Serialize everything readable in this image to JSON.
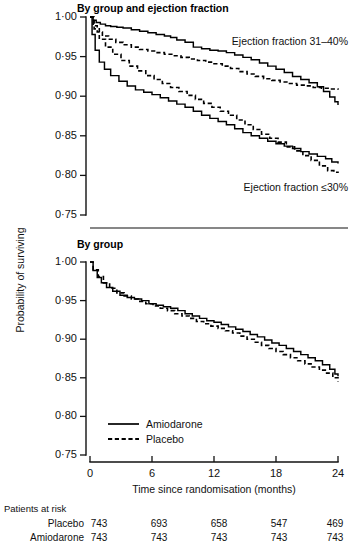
{
  "figure": {
    "y_axis_label": "Probability of surviving",
    "x_axis_label": "Time since randomisation (months)",
    "y_ticks": [
      "1·00",
      "0·95",
      "0·90",
      "0·85",
      "0·80",
      "0·75"
    ],
    "x_ticks": [
      "0",
      "6",
      "12",
      "18",
      "24"
    ],
    "colors": {
      "ink": "#000000",
      "axis": "#111111",
      "background": "#ffffff"
    }
  },
  "panel_top": {
    "title": "By group and ejection fraction",
    "annotation_upper": "Ejection fraction 31–40%",
    "annotation_lower": "Ejection fraction ≤30%"
  },
  "panel_bottom": {
    "title": "By group",
    "legend": [
      {
        "label": "Amiodarone",
        "style": "solid"
      },
      {
        "label": "Placebo",
        "style": "dashed"
      }
    ]
  },
  "risk_table": {
    "heading": "Patients at risk",
    "rows": [
      {
        "label": "Placebo",
        "values": [
          "743",
          "693",
          "658",
          "547",
          "469"
        ]
      },
      {
        "label": "Amiodarone",
        "values": [
          "743",
          "743",
          "743",
          "743",
          "743"
        ]
      }
    ]
  },
  "chart_data": {
    "type": "line",
    "xlabel": "Time since randomisation (months)",
    "ylabel": "Probability of surviving",
    "xlim": [
      0,
      24
    ],
    "ylim": [
      0.75,
      1.0
    ],
    "xticks": [
      0,
      6,
      12,
      18,
      24
    ],
    "yticks": [
      0.75,
      0.8,
      0.85,
      0.9,
      0.95,
      1.0
    ],
    "grid": false,
    "legend_position": "inside-bottom-left",
    "panels": [
      {
        "name": "By group and ejection fraction",
        "annotations": [
          {
            "text": "Ejection fraction 31–40%",
            "x": 13.5,
            "y": 0.962
          },
          {
            "text": "Ejection fraction ≤30%",
            "x": 14.5,
            "y": 0.787
          }
        ],
        "series": [
          {
            "name": "Amiodarone, ejection fraction 31–40%",
            "style": "solid",
            "x": [
              0.0,
              0.3,
              0.6,
              1.0,
              1.5,
              2.0,
              2.6,
              3.2,
              4.0,
              4.8,
              5.6,
              6.4,
              7.2,
              7.8,
              8.4,
              9.2,
              10.0,
              10.8,
              11.6,
              12.4,
              13.2,
              14.0,
              14.8,
              15.6,
              16.4,
              17.2,
              18.0,
              18.8,
              19.6,
              20.4,
              21.2,
              22.0,
              22.6,
              23.2,
              23.7,
              24.0
            ],
            "y": [
              1.0,
              0.996,
              0.993,
              0.991,
              0.989,
              0.988,
              0.987,
              0.986,
              0.984,
              0.982,
              0.98,
              0.978,
              0.976,
              0.974,
              0.971,
              0.968,
              0.962,
              0.96,
              0.958,
              0.957,
              0.955,
              0.952,
              0.949,
              0.946,
              0.942,
              0.938,
              0.934,
              0.93,
              0.925,
              0.921,
              0.917,
              0.912,
              0.906,
              0.899,
              0.893,
              0.889
            ]
          },
          {
            "name": "Placebo, ejection fraction 31–40%",
            "style": "dashed",
            "x": [
              0.0,
              0.3,
              0.7,
              1.2,
              1.8,
              2.5,
              3.2,
              4.0,
              4.8,
              5.6,
              6.4,
              7.2,
              8.0,
              8.8,
              9.6,
              10.4,
              11.2,
              12.0,
              12.8,
              13.6,
              14.4,
              15.2,
              16.0,
              16.8,
              17.6,
              18.4,
              19.2,
              20.0,
              20.8,
              21.6,
              22.4,
              23.2,
              24.0
            ],
            "y": [
              1.0,
              0.989,
              0.981,
              0.976,
              0.972,
              0.968,
              0.965,
              0.962,
              0.959,
              0.957,
              0.955,
              0.953,
              0.951,
              0.949,
              0.947,
              0.945,
              0.943,
              0.941,
              0.938,
              0.935,
              0.931,
              0.928,
              0.925,
              0.922,
              0.92,
              0.918,
              0.916,
              0.914,
              0.913,
              0.911,
              0.91,
              0.909,
              0.908
            ]
          },
          {
            "name": "Amiodarone, ejection fraction ≤30%",
            "style": "solid",
            "x": [
              0.0,
              0.2,
              0.5,
              0.9,
              1.4,
              2.0,
              2.8,
              3.6,
              4.4,
              5.2,
              6.0,
              6.8,
              7.6,
              8.4,
              9.2,
              10.0,
              10.8,
              11.6,
              12.4,
              13.2,
              14.0,
              14.8,
              15.6,
              16.4,
              17.2,
              18.0,
              18.8,
              19.6,
              20.4,
              21.2,
              22.0,
              22.8,
              23.4,
              24.0
            ],
            "y": [
              1.0,
              0.978,
              0.958,
              0.943,
              0.934,
              0.926,
              0.919,
              0.913,
              0.908,
              0.905,
              0.902,
              0.898,
              0.894,
              0.89,
              0.886,
              0.881,
              0.876,
              0.872,
              0.868,
              0.864,
              0.859,
              0.854,
              0.85,
              0.847,
              0.843,
              0.84,
              0.837,
              0.834,
              0.83,
              0.827,
              0.824,
              0.821,
              0.817,
              0.815
            ]
          },
          {
            "name": "Placebo, ejection fraction ≤30%",
            "style": "dashed",
            "x": [
              0.0,
              0.4,
              0.9,
              1.5,
              2.2,
              3.0,
              3.8,
              4.6,
              5.4,
              6.2,
              7.0,
              7.8,
              8.6,
              9.4,
              10.2,
              11.0,
              11.8,
              12.6,
              13.4,
              14.2,
              15.0,
              15.8,
              16.6,
              17.4,
              18.2,
              19.0,
              19.8,
              20.6,
              21.4,
              22.2,
              23.0,
              23.6,
              24.0
            ],
            "y": [
              1.0,
              0.985,
              0.972,
              0.962,
              0.953,
              0.945,
              0.938,
              0.932,
              0.926,
              0.921,
              0.916,
              0.911,
              0.906,
              0.901,
              0.896,
              0.891,
              0.886,
              0.881,
              0.876,
              0.87,
              0.864,
              0.858,
              0.852,
              0.847,
              0.842,
              0.836,
              0.831,
              0.825,
              0.819,
              0.812,
              0.806,
              0.804,
              0.803
            ]
          }
        ]
      },
      {
        "name": "By group",
        "annotations": [],
        "series": [
          {
            "name": "Amiodarone",
            "style": "solid",
            "x": [
              0.0,
              0.3,
              0.7,
              1.1,
              1.6,
              2.2,
              2.9,
              3.6,
              4.3,
              5.0,
              5.7,
              6.4,
              7.1,
              7.8,
              8.5,
              9.2,
              9.9,
              10.6,
              11.3,
              12.0,
              12.7,
              13.4,
              14.1,
              14.8,
              15.5,
              16.2,
              16.9,
              17.6,
              18.3,
              19.0,
              19.7,
              20.4,
              21.1,
              21.8,
              22.5,
              23.2,
              23.7,
              24.0
            ],
            "y": [
              1.0,
              0.989,
              0.98,
              0.973,
              0.967,
              0.962,
              0.957,
              0.954,
              0.952,
              0.95,
              0.946,
              0.944,
              0.942,
              0.94,
              0.937,
              0.933,
              0.93,
              0.927,
              0.924,
              0.922,
              0.919,
              0.916,
              0.913,
              0.91,
              0.906,
              0.903,
              0.899,
              0.895,
              0.892,
              0.888,
              0.884,
              0.88,
              0.876,
              0.872,
              0.867,
              0.861,
              0.855,
              0.852
            ]
          },
          {
            "name": "Placebo",
            "style": "dashed",
            "x": [
              0.0,
              0.3,
              0.8,
              1.3,
              1.9,
              2.6,
              3.3,
              4.0,
              4.7,
              5.4,
              6.1,
              6.8,
              7.5,
              8.2,
              8.9,
              9.6,
              10.3,
              11.0,
              11.7,
              12.4,
              13.1,
              13.8,
              14.5,
              15.2,
              15.9,
              16.6,
              17.3,
              18.0,
              18.7,
              19.4,
              20.1,
              20.8,
              21.5,
              22.2,
              22.9,
              23.5,
              24.0
            ],
            "y": [
              1.0,
              0.99,
              0.981,
              0.973,
              0.966,
              0.96,
              0.956,
              0.952,
              0.949,
              0.946,
              0.943,
              0.94,
              0.937,
              0.933,
              0.93,
              0.927,
              0.923,
              0.92,
              0.917,
              0.914,
              0.911,
              0.908,
              0.904,
              0.9,
              0.896,
              0.892,
              0.888,
              0.884,
              0.88,
              0.876,
              0.872,
              0.868,
              0.864,
              0.86,
              0.856,
              0.85,
              0.845
            ]
          }
        ]
      }
    ]
  }
}
